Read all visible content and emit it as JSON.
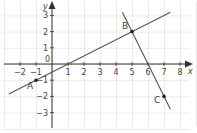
{
  "diagram": {
    "type": "coordinate-graph",
    "axes": {
      "x_label": "x",
      "y_label": "y",
      "origin_label": "0",
      "x_ticks": [
        {
          "value": -2,
          "label": "−2"
        },
        {
          "value": -1,
          "label": "−1"
        },
        {
          "value": 1,
          "label": "1"
        },
        {
          "value": 2,
          "label": "2"
        },
        {
          "value": 3,
          "label": "3"
        },
        {
          "value": 4,
          "label": "4"
        },
        {
          "value": 5,
          "label": "5"
        },
        {
          "value": 6,
          "label": "6"
        },
        {
          "value": 7,
          "label": "7"
        },
        {
          "value": 8,
          "label": "8"
        }
      ],
      "y_ticks": [
        {
          "value": 3,
          "label": "3"
        },
        {
          "value": 2,
          "label": "2"
        },
        {
          "value": 1,
          "label": "1"
        },
        {
          "value": -1,
          "label": "−1"
        },
        {
          "value": -2,
          "label": "−2"
        },
        {
          "value": -3,
          "label": "−3"
        }
      ]
    },
    "points": [
      {
        "label": "A",
        "x": -1,
        "y": -1
      },
      {
        "label": "B",
        "x": 5,
        "y": 2
      },
      {
        "label": "C",
        "x": 7,
        "y": -2
      }
    ],
    "lines": [
      {
        "name": "line-AB",
        "from": [
          -2.7,
          -1.85
        ],
        "to": [
          7.4,
          3.2
        ]
      },
      {
        "name": "line-BC",
        "from": [
          4.4,
          3.2
        ],
        "to": [
          7.4,
          -2.8
        ]
      }
    ],
    "colors": {
      "grid": "#dcdcdc",
      "axis": "#333333",
      "line": "#555555",
      "point": "#222222",
      "text": "#444444"
    }
  }
}
